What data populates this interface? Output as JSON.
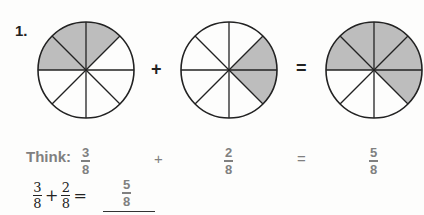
{
  "problem": {
    "number": "1.",
    "circles": [
      {
        "parts": 8,
        "shaded": [
          4,
          5,
          6
        ],
        "cx": 86,
        "cy": 70,
        "r": 48
      },
      {
        "parts": 8,
        "shaded": [
          7,
          0
        ],
        "cx": 229,
        "cy": 70,
        "r": 48
      },
      {
        "parts": 8,
        "shaded": [
          4,
          5,
          6,
          7,
          0
        ],
        "cx": 374,
        "cy": 70,
        "r": 48
      }
    ],
    "plus": "+",
    "equals": "=",
    "shade_color": "#bdbdbd",
    "think": {
      "label": "Think:",
      "a": {
        "num": "3",
        "den": "8"
      },
      "plus": "+",
      "b": {
        "num": "2",
        "den": "8"
      },
      "equals": "=",
      "c": {
        "num": "5",
        "den": "8"
      }
    },
    "equation": {
      "a": {
        "num": "3",
        "den": "8"
      },
      "plus": "+",
      "b": {
        "num": "2",
        "den": "8"
      },
      "equals": "=",
      "answer": {
        "num": "5",
        "den": "8"
      }
    }
  }
}
